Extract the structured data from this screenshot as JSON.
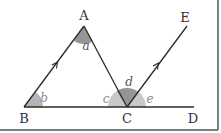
{
  "diagram": {
    "type": "geometry",
    "points": {
      "A": {
        "label": "A"
      },
      "B": {
        "label": "B"
      },
      "C": {
        "label": "C"
      },
      "D": {
        "label": "D"
      },
      "E": {
        "label": "E"
      }
    },
    "angles": {
      "a": {
        "label": "a",
        "vertex": "A"
      },
      "b": {
        "label": "b",
        "vertex": "B"
      },
      "c": {
        "label": "c",
        "vertex": "C"
      },
      "d": {
        "label": "d",
        "vertex": "C"
      },
      "e": {
        "label": "e",
        "vertex": "C"
      }
    },
    "parallel_marks": [
      "BA",
      "CE"
    ],
    "colors": {
      "line": "#2a2a2a",
      "angle_fill_dark": "#8f8f8f",
      "angle_fill_light": "#c4c4c4",
      "border": "#555555"
    }
  }
}
